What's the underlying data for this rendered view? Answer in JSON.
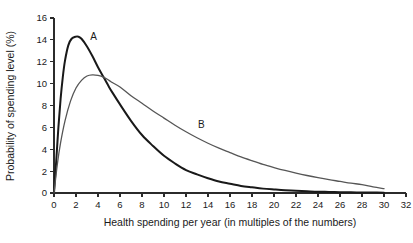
{
  "chart_data": {
    "type": "line",
    "title": "",
    "subtitle": "",
    "xlabel": "Health spending per year (in multiples of the numbers)",
    "ylabel": "Probability of spending level (%)",
    "xlim": [
      0,
      32
    ],
    "ylim": [
      0,
      16
    ],
    "grid": false,
    "legend_position": "inline-annotation",
    "x_ticks": [
      0,
      2,
      4,
      6,
      8,
      10,
      12,
      14,
      16,
      18,
      20,
      22,
      24,
      26,
      28,
      30,
      32
    ],
    "x_tick_labels": [
      "0",
      "2",
      "4",
      "6",
      "8",
      "10",
      "12",
      "14",
      "16",
      "18",
      "20",
      "22",
      "24",
      "26",
      "28",
      "30",
      "32"
    ],
    "y_ticks": [
      0,
      2,
      4,
      6,
      8,
      10,
      12,
      14,
      16
    ],
    "y_tick_labels": [
      "0",
      "2",
      "4",
      "6",
      "8",
      "10",
      "12",
      "14",
      "16"
    ],
    "annotations": [
      {
        "text": "A",
        "x": 3.6,
        "y": 14.0
      },
      {
        "text": "B",
        "x": 13.4,
        "y": 5.9
      }
    ],
    "series": [
      {
        "name": "A",
        "label": "A",
        "color": "#191919",
        "line_width": 2.0,
        "peak": {
          "x": 2.2,
          "y": 14.3
        },
        "x": [
          0,
          0.2,
          0.4,
          0.6,
          0.8,
          1.0,
          1.3,
          1.6,
          2.0,
          2.2,
          2.5,
          3.0,
          3.5,
          4.0,
          4.5,
          5.0,
          5.3,
          6.0,
          7.0,
          8.0,
          9.0,
          10.0,
          11.0,
          12.0,
          13.0,
          14.0,
          15.0,
          16.0,
          17.0,
          18.0,
          19.0,
          20.0,
          21.0,
          22.0,
          23.0,
          24.0,
          25.0,
          26.0,
          27.0,
          28.0,
          29.0,
          30.0
        ],
        "y": [
          0.0,
          2.9,
          6.0,
          8.6,
          10.6,
          12.1,
          13.5,
          14.1,
          14.3,
          14.3,
          14.1,
          13.4,
          12.5,
          11.5,
          10.6,
          9.7,
          9.2,
          8.1,
          6.6,
          5.3,
          4.3,
          3.4,
          2.7,
          2.1,
          1.7,
          1.35,
          1.05,
          0.85,
          0.65,
          0.52,
          0.4,
          0.32,
          0.25,
          0.2,
          0.16,
          0.12,
          0.1,
          0.08,
          0.06,
          0.05,
          0.04,
          0.03
        ]
      },
      {
        "name": "B",
        "label": "B",
        "color": "#565656",
        "line_width": 1.3,
        "peak": {
          "x": 3.5,
          "y": 10.8
        },
        "x": [
          0,
          0.3,
          0.6,
          1.0,
          1.5,
          2.0,
          2.5,
          3.0,
          3.5,
          4.0,
          4.5,
          5.0,
          5.3,
          6.0,
          7.0,
          8.0,
          9.0,
          10.0,
          11.0,
          12.0,
          13.0,
          14.0,
          15.0,
          16.0,
          17.0,
          18.0,
          19.0,
          20.0,
          21.0,
          22.0,
          23.0,
          24.0,
          25.0,
          26.0,
          27.0,
          28.0,
          29.0,
          30.0
        ],
        "y": [
          0.0,
          2.6,
          4.6,
          6.6,
          8.4,
          9.6,
          10.3,
          10.7,
          10.8,
          10.75,
          10.6,
          10.3,
          10.1,
          9.7,
          8.9,
          8.2,
          7.5,
          6.85,
          6.2,
          5.6,
          5.05,
          4.55,
          4.1,
          3.7,
          3.3,
          2.95,
          2.62,
          2.33,
          2.06,
          1.82,
          1.6,
          1.4,
          1.22,
          1.06,
          0.9,
          0.77,
          0.57,
          0.4
        ]
      }
    ],
    "crossing_point": {
      "x": 5.3,
      "y": 10.0
    }
  },
  "axes": {
    "y_title": "Probability of spending level (%)",
    "x_title": "Health spending per year (in multiples of the numbers)"
  },
  "labels": {
    "series_a": "A",
    "series_b": "B"
  },
  "colors": {
    "background": "#ffffff",
    "axis": "#2b2b2b",
    "text": "#1a1a1a",
    "series_a": "#191919",
    "series_b": "#565656"
  }
}
